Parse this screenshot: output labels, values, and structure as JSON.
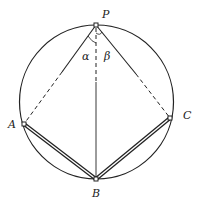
{
  "diagram": {
    "type": "geometry",
    "circle": {
      "cx": 96.5,
      "cy": 102,
      "r": 77
    },
    "points": {
      "P": {
        "label": "P",
        "x": 96,
        "y": 25
      },
      "A": {
        "label": "A",
        "x": 24,
        "y": 124
      },
      "B": {
        "label": "B",
        "x": 96,
        "y": 179
      },
      "C": {
        "label": "C",
        "x": 170,
        "y": 118
      }
    },
    "angles": {
      "alpha": {
        "label": "α"
      },
      "beta": {
        "label": "β"
      }
    },
    "colors": {
      "stroke": "#222222",
      "background": "#ffffff"
    }
  }
}
